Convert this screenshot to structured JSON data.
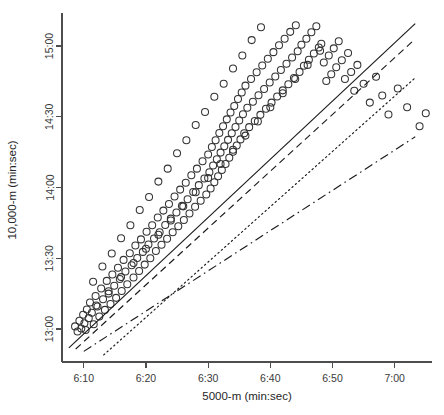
{
  "chart_data": {
    "type": "scatter",
    "title": "",
    "xlabel": "5000-m (min:sec)",
    "ylabel": "10,000-m (min:sec)",
    "grid": false,
    "legend": "none",
    "x_tick_labels": [
      "6:10",
      "6:20",
      "6:30",
      "6:40",
      "6:50",
      "7:00"
    ],
    "x_tick_values": [
      370,
      380,
      390,
      400,
      410,
      420
    ],
    "y_tick_labels": [
      "13:00",
      "13:30",
      "14:00",
      "14:30",
      "15:00"
    ],
    "y_tick_values": [
      780,
      810,
      840,
      870,
      900
    ],
    "xlim": [
      366.5,
      426.0
    ],
    "ylim": [
      766.0,
      914.0
    ],
    "x_units": "seconds",
    "y_units": "seconds",
    "marker": "open-circle",
    "marker_size_px": 7,
    "points": [
      [
        368.6,
        781.1
      ],
      [
        369.0,
        778.9
      ],
      [
        369.3,
        783.5
      ],
      [
        369.6,
        780.2
      ],
      [
        369.9,
        786.0
      ],
      [
        370.1,
        782.4
      ],
      [
        370.3,
        779.6
      ],
      [
        370.5,
        788.3
      ],
      [
        370.8,
        784.6
      ],
      [
        371.0,
        791.2
      ],
      [
        371.3,
        786.9
      ],
      [
        371.6,
        782.0
      ],
      [
        371.9,
        794.0
      ],
      [
        372.2,
        789.5
      ],
      [
        372.5,
        785.3
      ],
      [
        372.8,
        797.2
      ],
      [
        373.1,
        792.6
      ],
      [
        373.4,
        788.1
      ],
      [
        373.7,
        800.4
      ],
      [
        374.0,
        795.0
      ],
      [
        374.3,
        790.6
      ],
      [
        374.6,
        803.1
      ],
      [
        374.9,
        798.3
      ],
      [
        375.2,
        793.2
      ],
      [
        375.5,
        806.0
      ],
      [
        375.8,
        801.2
      ],
      [
        376.1,
        796.1
      ],
      [
        376.4,
        809.3
      ],
      [
        376.7,
        804.4
      ],
      [
        377.0,
        799.0
      ],
      [
        377.4,
        812.1
      ],
      [
        377.7,
        807.0
      ],
      [
        378.0,
        801.8
      ],
      [
        378.3,
        815.4
      ],
      [
        378.6,
        810.1
      ],
      [
        378.9,
        804.6
      ],
      [
        379.2,
        818.0
      ],
      [
        379.5,
        812.7
      ],
      [
        379.8,
        807.3
      ],
      [
        380.1,
        821.2
      ],
      [
        380.4,
        815.8
      ],
      [
        380.7,
        810.0
      ],
      [
        381.0,
        824.0
      ],
      [
        381.3,
        818.4
      ],
      [
        381.6,
        813.1
      ],
      [
        381.9,
        827.3
      ],
      [
        382.2,
        821.0
      ],
      [
        382.5,
        815.7
      ],
      [
        382.8,
        830.2
      ],
      [
        383.1,
        824.1
      ],
      [
        383.4,
        818.3
      ],
      [
        383.7,
        833.0
      ],
      [
        384.0,
        826.8
      ],
      [
        384.3,
        821.0
      ],
      [
        384.6,
        836.2
      ],
      [
        384.9,
        829.4
      ],
      [
        385.2,
        823.6
      ],
      [
        385.5,
        839.1
      ],
      [
        385.8,
        832.2
      ],
      [
        386.1,
        826.2
      ],
      [
        386.4,
        842.0
      ],
      [
        386.7,
        835.0
      ],
      [
        387.0,
        829.0
      ],
      [
        387.3,
        845.2
      ],
      [
        387.6,
        838.1
      ],
      [
        387.9,
        831.8
      ],
      [
        388.2,
        848.0
      ],
      [
        388.5,
        841.0
      ],
      [
        388.8,
        834.4
      ],
      [
        389.1,
        851.1
      ],
      [
        389.4,
        843.8
      ],
      [
        389.7,
        837.0
      ],
      [
        390.0,
        854.0
      ],
      [
        390.2,
        846.5
      ],
      [
        390.4,
        839.6
      ],
      [
        390.6,
        857.2
      ],
      [
        390.8,
        849.3
      ],
      [
        391.0,
        842.2
      ],
      [
        391.2,
        860.0
      ],
      [
        391.4,
        852.0
      ],
      [
        391.6,
        844.8
      ],
      [
        391.8,
        863.1
      ],
      [
        392.0,
        854.8
      ],
      [
        392.2,
        847.4
      ],
      [
        392.4,
        866.0
      ],
      [
        392.6,
        857.5
      ],
      [
        392.8,
        850.0
      ],
      [
        393.0,
        868.9
      ],
      [
        393.2,
        860.2
      ],
      [
        393.4,
        852.6
      ],
      [
        393.6,
        871.8
      ],
      [
        393.8,
        863.0
      ],
      [
        394.0,
        855.2
      ],
      [
        394.2,
        874.6
      ],
      [
        394.4,
        865.7
      ],
      [
        394.6,
        857.8
      ],
      [
        394.8,
        877.5
      ],
      [
        395.0,
        868.4
      ],
      [
        395.2,
        860.4
      ],
      [
        395.4,
        880.3
      ],
      [
        395.6,
        871.1
      ],
      [
        395.8,
        863.0
      ],
      [
        396.0,
        883.2
      ],
      [
        396.3,
        873.8
      ],
      [
        396.6,
        865.6
      ],
      [
        396.9,
        886.0
      ],
      [
        397.2,
        876.4
      ],
      [
        397.5,
        868.2
      ],
      [
        397.8,
        888.9
      ],
      [
        398.1,
        879.1
      ],
      [
        398.4,
        870.8
      ],
      [
        398.7,
        891.7
      ],
      [
        399.0,
        881.8
      ],
      [
        399.3,
        873.4
      ],
      [
        399.6,
        894.6
      ],
      [
        399.9,
        884.5
      ],
      [
        400.2,
        876.0
      ],
      [
        400.5,
        897.4
      ],
      [
        400.8,
        887.1
      ],
      [
        401.1,
        878.6
      ],
      [
        401.4,
        900.3
      ],
      [
        401.7,
        889.8
      ],
      [
        402.0,
        881.2
      ],
      [
        402.3,
        903.1
      ],
      [
        402.6,
        892.5
      ],
      [
        402.9,
        883.8
      ],
      [
        403.2,
        906.0
      ],
      [
        403.5,
        895.1
      ],
      [
        403.8,
        886.4
      ],
      [
        404.1,
        908.8
      ],
      [
        404.4,
        897.8
      ],
      [
        404.7,
        889.0
      ],
      [
        405.0,
        900.5
      ],
      [
        405.4,
        891.6
      ],
      [
        405.8,
        903.1
      ],
      [
        406.2,
        894.2
      ],
      [
        406.6,
        905.8
      ],
      [
        407.0,
        896.8
      ],
      [
        407.4,
        908.4
      ],
      [
        407.8,
        899.4
      ],
      [
        408.2,
        901.0
      ],
      [
        408.6,
        893.0
      ],
      [
        409.0,
        885.2
      ],
      [
        409.4,
        896.0
      ],
      [
        409.8,
        888.0
      ],
      [
        410.2,
        899.0
      ],
      [
        410.6,
        891.0
      ],
      [
        411.0,
        902.0
      ],
      [
        411.5,
        894.0
      ],
      [
        412.0,
        886.0
      ],
      [
        412.5,
        897.0
      ],
      [
        413.0,
        889.0
      ],
      [
        413.5,
        881.0
      ],
      [
        414.0,
        892.0
      ],
      [
        415.0,
        884.0
      ],
      [
        416.0,
        876.0
      ],
      [
        417.0,
        887.0
      ],
      [
        418.0,
        879.0
      ],
      [
        419.0,
        871.0
      ],
      [
        420.5,
        882.0
      ],
      [
        422.0,
        874.0
      ],
      [
        424.0,
        866.0
      ],
      [
        425.0,
        871.5
      ],
      [
        371.5,
        800.0
      ],
      [
        373.0,
        806.5
      ],
      [
        374.5,
        812.0
      ],
      [
        376.0,
        818.5
      ],
      [
        377.5,
        824.0
      ],
      [
        379.0,
        830.5
      ],
      [
        380.5,
        836.0
      ],
      [
        382.0,
        842.5
      ],
      [
        383.5,
        848.0
      ],
      [
        385.0,
        854.5
      ],
      [
        386.5,
        860.0
      ],
      [
        388.0,
        866.5
      ],
      [
        389.5,
        872.0
      ],
      [
        391.0,
        878.5
      ],
      [
        392.5,
        884.0
      ],
      [
        394.0,
        890.5
      ],
      [
        395.5,
        896.0
      ],
      [
        397.0,
        902.5
      ],
      [
        398.5,
        908.0
      ],
      [
        372.0,
        790.0
      ],
      [
        374.0,
        796.0
      ],
      [
        376.0,
        802.0
      ],
      [
        378.0,
        808.0
      ],
      [
        380.0,
        814.0
      ],
      [
        382.0,
        820.0
      ],
      [
        384.0,
        826.0
      ],
      [
        386.0,
        832.0
      ],
      [
        388.0,
        838.0
      ],
      [
        390.0,
        844.0
      ],
      [
        392.0,
        850.0
      ],
      [
        394.0,
        856.0
      ],
      [
        396.0,
        862.0
      ],
      [
        398.0,
        868.0
      ],
      [
        400.0,
        874.0
      ],
      [
        402.0,
        880.0
      ],
      [
        404.0,
        886.0
      ],
      [
        406.0,
        892.0
      ],
      [
        408.0,
        898.0
      ]
    ],
    "lines": [
      {
        "name": "solid-fit",
        "style": "solid",
        "x0": 367.6,
        "y0": 772.0,
        "x1": 423.3,
        "y1": 909.5
      },
      {
        "name": "dashed-fit",
        "style": "dashed",
        "x0": 368.7,
        "y0": 771.5,
        "x1": 423.3,
        "y1": 903.0
      },
      {
        "name": "dotted-fit",
        "style": "dotted",
        "x0": 373.2,
        "y0": 769.0,
        "x1": 423.3,
        "y1": 886.5
      },
      {
        "name": "dashdot-fit",
        "style": "dashdot",
        "x0": 370.0,
        "y0": 770.5,
        "x1": 423.3,
        "y1": 861.5
      }
    ]
  }
}
